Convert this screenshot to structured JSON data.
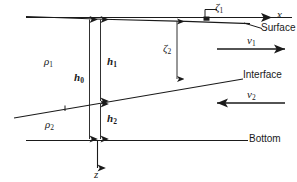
{
  "figure": {
    "domain": "diagram",
    "background_color": "#ffffff",
    "line_color": "#1a1a1a",
    "width": 297,
    "height": 182
  },
  "axes": {
    "x_label": "x",
    "z_label": "z"
  },
  "boundaries": {
    "surface_label": "Surface",
    "interface_label": "Interface",
    "bottom_label": "Bottom"
  },
  "densities": {
    "upper_layer": "ρ",
    "upper_layer_sub": "1",
    "lower_layer": "ρ",
    "lower_layer_sub": "2"
  },
  "depths": {
    "total": "h",
    "total_sub": "0",
    "upper": "h",
    "upper_sub": "1",
    "lower": "h",
    "lower_sub": "2"
  },
  "displacements": {
    "surface": "ζ",
    "surface_sub": "1",
    "interface": "ζ",
    "interface_sub": "2"
  },
  "velocities": {
    "upper": "v",
    "upper_sub": "1",
    "upper_direction": "right",
    "lower": "v",
    "lower_sub": "2",
    "lower_direction": "left"
  },
  "markers": {
    "surface_point": "surface-displacement-marker",
    "interface_tick": "interface-tick-mark"
  }
}
